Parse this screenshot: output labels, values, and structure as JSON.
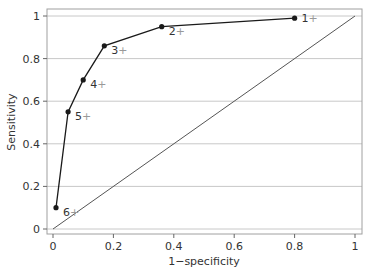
{
  "chart_data": {
    "type": "line",
    "title": "",
    "xlabel": "1−specificity",
    "ylabel": "Sensitivity",
    "xlim": [
      0,
      1
    ],
    "ylim": [
      0,
      1
    ],
    "grid": "horizontal",
    "x_ticks": [
      0,
      0.2,
      0.4,
      0.6,
      0.8,
      1
    ],
    "x_tick_labels": [
      "0",
      "0.2",
      "0.4",
      "0.6",
      "0.8",
      "1"
    ],
    "y_ticks": [
      0,
      0.2,
      0.4,
      0.6,
      0.8,
      1
    ],
    "y_tick_labels": [
      "0",
      "0.2",
      "0.4",
      "0.6",
      "0.8",
      "1"
    ],
    "series": [
      {
        "name": "ROC curve",
        "points": [
          {
            "label": "6+",
            "x": 0.01,
            "y": 0.1
          },
          {
            "label": "5+",
            "x": 0.05,
            "y": 0.55
          },
          {
            "label": "4+",
            "x": 0.1,
            "y": 0.7
          },
          {
            "label": "3+",
            "x": 0.17,
            "y": 0.86
          },
          {
            "label": "2+",
            "x": 0.36,
            "y": 0.95
          },
          {
            "label": "1+",
            "x": 0.8,
            "y": 0.99
          }
        ]
      },
      {
        "name": "Reference line",
        "points": [
          {
            "x": 0,
            "y": 0
          },
          {
            "x": 1,
            "y": 1
          }
        ]
      }
    ],
    "colors": {
      "curve": "#1a1a1a",
      "reference": "#555555",
      "grid": "#c8c8c8",
      "frame": "#a0a0a0"
    }
  }
}
